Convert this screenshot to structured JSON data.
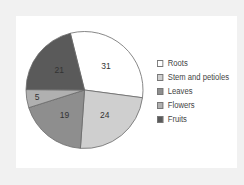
{
  "chart_data": {
    "type": "pie",
    "title": "",
    "categories": [
      "Roots",
      "Stem and petioles",
      "Leaves",
      "Flowers",
      "Fruits"
    ],
    "values": [
      31,
      24,
      19,
      5,
      21
    ],
    "colors": [
      "#ffffff",
      "#cfcfcf",
      "#8e8e8e",
      "#b0b0b0",
      "#5a5a5a"
    ],
    "data_labels": [
      "31",
      "24",
      "19",
      "5",
      "21"
    ],
    "start_angle_deg": -14,
    "direction": "clockwise",
    "legend_position": "right"
  },
  "legend": {
    "items": [
      {
        "label": "Roots",
        "color": "#ffffff"
      },
      {
        "label": "Stem and petioles",
        "color": "#cfcfcf"
      },
      {
        "label": "Leaves",
        "color": "#8e8e8e"
      },
      {
        "label": "Flowers",
        "color": "#b0b0b0"
      },
      {
        "label": "Fruits",
        "color": "#5a5a5a"
      }
    ]
  }
}
